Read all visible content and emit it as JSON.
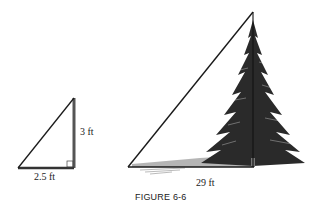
{
  "figure": {
    "caption": "FIGURE 6-6",
    "small_triangle": {
      "height_label": "3 ft",
      "base_label": "2.5 ft",
      "right_angle": true
    },
    "large_triangle": {
      "base_label": "29 ft",
      "object": "pine tree"
    },
    "colors": {
      "line": "#1a1a1a",
      "tree": "#2a2a2a",
      "shadow": "#9a9a9a"
    }
  }
}
